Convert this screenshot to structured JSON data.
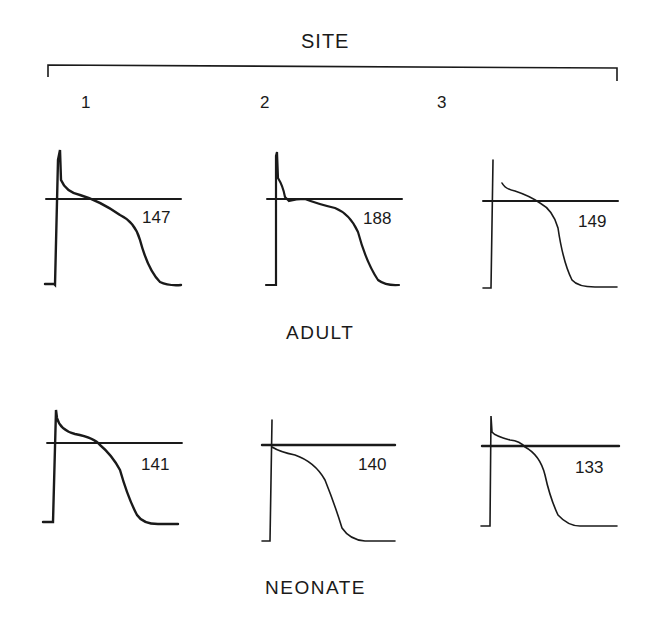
{
  "figure": {
    "title": "SITE",
    "sites": [
      "1",
      "2",
      "3"
    ],
    "groups": [
      {
        "label": "ADULT",
        "traces": [
          {
            "site": "1",
            "duration": "147"
          },
          {
            "site": "2",
            "duration": "188"
          },
          {
            "site": "3",
            "duration": "149"
          }
        ]
      },
      {
        "label": "NEONATE",
        "traces": [
          {
            "site": "1",
            "duration": "141"
          },
          {
            "site": "2",
            "duration": "140"
          },
          {
            "site": "3",
            "duration": "133"
          }
        ]
      }
    ]
  },
  "colors": {
    "ink": "#1a1a1a",
    "background": "#ffffff"
  }
}
